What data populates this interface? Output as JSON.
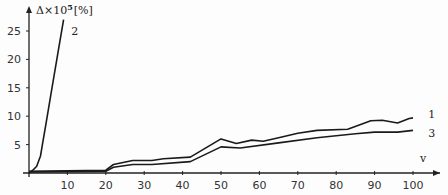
{
  "chart_data": {
    "type": "line",
    "title": "",
    "xlabel": "v",
    "ylabel": "Δ×10^5 [%]",
    "ylabel_parts": {
      "base": "Δ×10",
      "sup": "5",
      "unit": "[%]"
    },
    "xlim": [
      0,
      105
    ],
    "ylim": [
      0,
      27
    ],
    "x_ticks": [
      10,
      20,
      30,
      40,
      50,
      60,
      70,
      80,
      90,
      100
    ],
    "y_ticks": [
      5,
      10,
      15,
      20,
      25
    ],
    "grid": false,
    "legend": "inline curve labels",
    "series": [
      {
        "name": "1",
        "x": [
          0,
          20,
          22,
          27,
          32,
          35,
          42,
          50,
          54,
          58,
          61,
          65,
          70,
          75,
          83,
          89,
          92,
          96,
          99,
          100
        ],
        "values": [
          0.3,
          0.5,
          1.5,
          2.2,
          2.2,
          2.5,
          2.8,
          6.0,
          5.2,
          5.8,
          5.6,
          6.2,
          7.0,
          7.5,
          7.7,
          9.2,
          9.3,
          8.8,
          9.6,
          9.7
        ]
      },
      {
        "name": "2",
        "x": [
          0,
          1,
          2,
          3,
          3.5,
          4.5,
          6,
          7.5,
          9
        ],
        "values": [
          0,
          0.5,
          1.2,
          3.0,
          5.0,
          9.0,
          15.0,
          21.0,
          27.0
        ]
      },
      {
        "name": "3",
        "x": [
          0,
          20,
          22,
          27,
          32,
          42,
          50,
          55,
          65,
          75,
          85,
          90,
          96,
          100
        ],
        "values": [
          0.2,
          0.3,
          1.0,
          1.5,
          1.5,
          2.0,
          4.6,
          4.4,
          5.3,
          6.2,
          6.9,
          7.2,
          7.2,
          7.5
        ]
      }
    ],
    "annotations": [
      {
        "text": "1",
        "series": "1",
        "near": [
          104,
          10.3
        ]
      },
      {
        "text": "2",
        "series": "2",
        "near": [
          11,
          25
        ]
      },
      {
        "text": "3",
        "series": "3",
        "near": [
          104,
          7.0
        ]
      }
    ]
  },
  "layout": {
    "origin_px": [
      29,
      173
    ],
    "px_per_x": 3.84,
    "px_per_y": 5.68,
    "line_color": "#1a1a1a",
    "axis_color": "#222222"
  }
}
